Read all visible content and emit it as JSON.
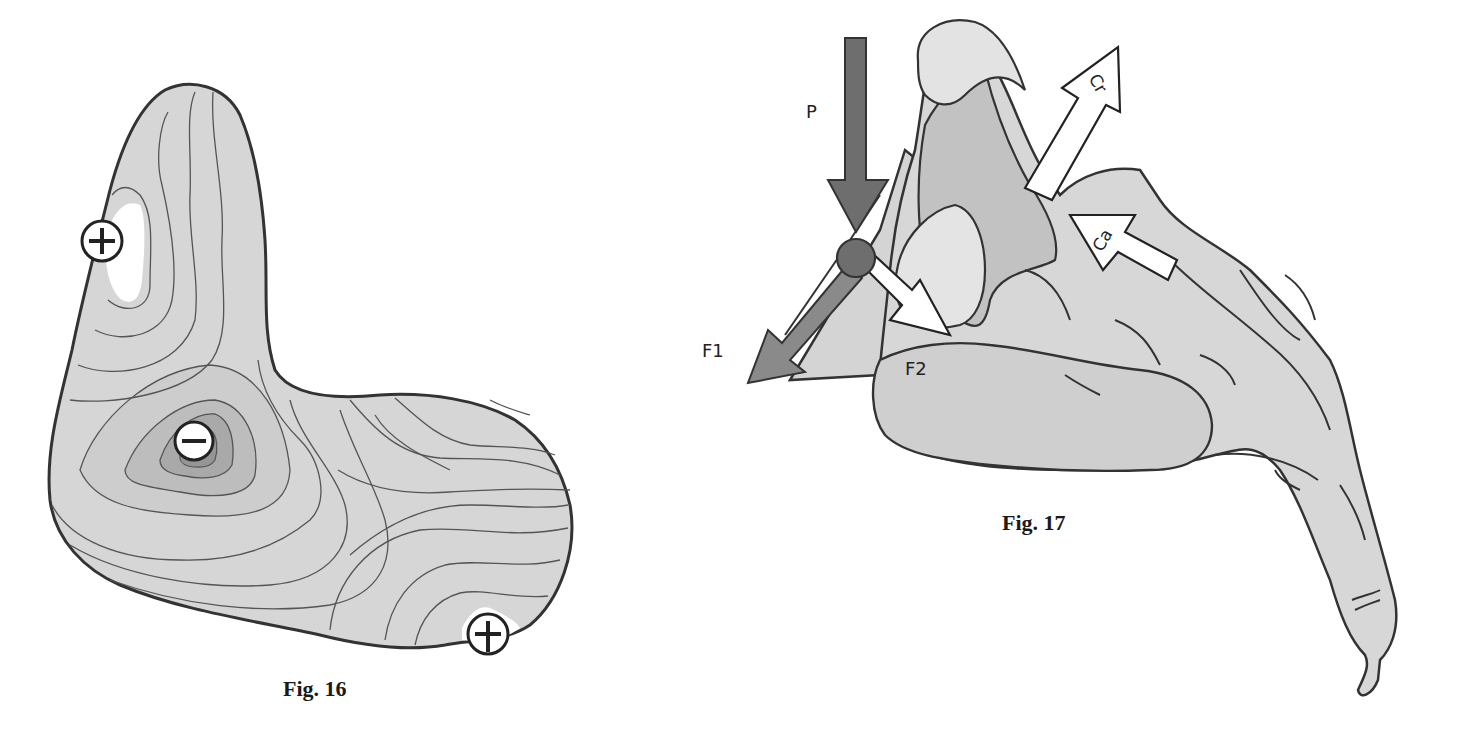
{
  "figures": [
    {
      "id": "fig16",
      "caption": "Fig. 16",
      "description": "Contour map of a bone-shaped region with stress contours",
      "markers": [
        {
          "symbol": "+",
          "label": "positive-marker-top",
          "x": 102,
          "y": 241
        },
        {
          "symbol": "−",
          "label": "negative-marker-center",
          "x": 194,
          "y": 441
        },
        {
          "symbol": "+",
          "label": "positive-marker-bottom",
          "x": 488,
          "y": 634
        }
      ]
    },
    {
      "id": "fig17",
      "caption": "Fig. 17",
      "description": "Force diagram on foot bone",
      "force_labels": {
        "p": "P",
        "f1": "F1",
        "f2": "F2",
        "cr": "Cr",
        "ca": "Ca"
      }
    }
  ],
  "colors": {
    "fill_light": "#d9d9d9",
    "fill_mid": "#c4c4c4",
    "fill_dark": "#a9a9a9",
    "fill_darker": "#8f8f8f",
    "stroke": "#333333",
    "contour": "#555555",
    "arrow_p": "#6e6e6e",
    "arrow_f1": "#8a8a8a",
    "white": "#ffffff"
  }
}
